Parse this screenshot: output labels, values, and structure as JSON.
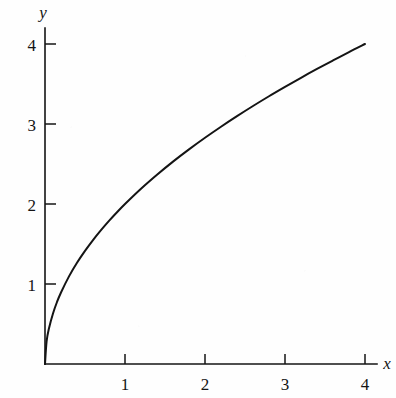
{
  "chart_data": {
    "type": "line",
    "title": "",
    "subtitle": "",
    "xlabel": "x",
    "ylabel": "y",
    "xlim": [
      0,
      4.35
    ],
    "ylim": [
      0,
      4.25
    ],
    "grid": false,
    "legend": null,
    "annotations": [],
    "x_ticks": [
      {
        "value": 1,
        "label": "1"
      },
      {
        "value": 2,
        "label": "2"
      },
      {
        "value": 3,
        "label": "3"
      },
      {
        "value": 4,
        "label": "4"
      }
    ],
    "y_ticks": [
      {
        "value": 1,
        "label": "1"
      },
      {
        "value": 2,
        "label": "2"
      },
      {
        "value": 3,
        "label": "3"
      },
      {
        "value": 4,
        "label": "4"
      }
    ],
    "series": [
      {
        "name": "y = 2*sqrt(x)",
        "color": "#141414",
        "x": [
          0,
          0.02,
          0.05,
          0.1,
          0.15,
          0.2,
          0.3,
          0.4,
          0.5,
          0.6,
          0.7,
          0.8,
          0.9,
          1.0,
          1.2,
          1.4,
          1.6,
          1.8,
          2.0,
          2.2,
          2.4,
          2.6,
          2.8,
          3.0,
          3.2,
          3.4,
          3.6,
          3.8,
          4.0
        ],
        "y": [
          0,
          0.283,
          0.447,
          0.632,
          0.775,
          0.894,
          1.095,
          1.265,
          1.414,
          1.549,
          1.673,
          1.789,
          1.897,
          2.0,
          2.191,
          2.366,
          2.53,
          2.683,
          2.828,
          2.966,
          3.098,
          3.225,
          3.347,
          3.464,
          3.578,
          3.688,
          3.794,
          3.899,
          4.0
        ]
      }
    ]
  },
  "axes": {
    "x_axis_label": "x",
    "y_axis_label": "y"
  },
  "colors": {
    "ink": "#141414",
    "paper": "#fefefe"
  }
}
